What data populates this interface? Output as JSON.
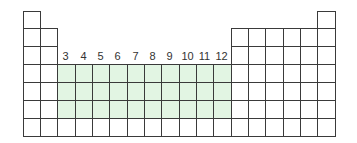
{
  "diagram": {
    "title": "",
    "highlight_color": "#e2f5e3",
    "border_color": "#3a3a3a",
    "columns": 18,
    "rows": 7,
    "row_lengths": {
      "1": [
        1,
        18
      ],
      "2": [
        1,
        2,
        13,
        14,
        15,
        16,
        17,
        18
      ],
      "3": [
        1,
        2,
        13,
        14,
        15,
        16,
        17,
        18
      ],
      "4": "all",
      "5": "all",
      "6": "all",
      "7": "all"
    },
    "highlighted": {
      "groups": [
        3,
        12
      ],
      "periods": [
        4,
        6
      ]
    },
    "group_labels": [
      {
        "group": 3,
        "text": "3"
      },
      {
        "group": 4,
        "text": "4"
      },
      {
        "group": 5,
        "text": "5"
      },
      {
        "group": 6,
        "text": "6"
      },
      {
        "group": 7,
        "text": "7"
      },
      {
        "group": 8,
        "text": "8"
      },
      {
        "group": 9,
        "text": "9"
      },
      {
        "group": 10,
        "text": "10"
      },
      {
        "group": 11,
        "text": "11"
      },
      {
        "group": 12,
        "text": "12"
      }
    ]
  }
}
